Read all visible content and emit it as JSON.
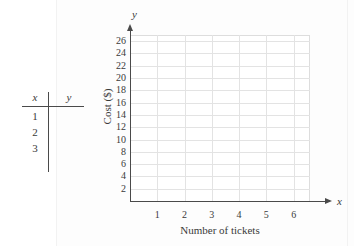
{
  "figure": {
    "kind": "blank-coordinate-grid-with-input-output-table"
  },
  "table": {
    "headers": {
      "x": "x",
      "y": "y"
    },
    "rows": [
      {
        "x": "1",
        "y": ""
      },
      {
        "x": "2",
        "y": ""
      },
      {
        "x": "3",
        "y": ""
      }
    ]
  },
  "chart_data": {
    "type": "scatter",
    "title": "",
    "xlabel": "Number of tickets",
    "ylabel": "Cost ($)",
    "axis_name_x": "x",
    "axis_name_y": "y",
    "x": [],
    "values": [],
    "series": [],
    "xlim": [
      0,
      6.6
    ],
    "ylim": [
      0,
      27
    ],
    "xticks": [
      "1",
      "2",
      "3",
      "4",
      "5",
      "6"
    ],
    "yticks": [
      "2",
      "4",
      "6",
      "8",
      "10",
      "12",
      "14",
      "16",
      "18",
      "20",
      "22",
      "24",
      "26"
    ],
    "xtick_values": [
      1,
      2,
      3,
      4,
      5,
      6
    ],
    "ytick_values": [
      2,
      4,
      6,
      8,
      10,
      12,
      14,
      16,
      18,
      20,
      22,
      24,
      26
    ],
    "grid": true,
    "legend": null,
    "annotations": [],
    "colors": {
      "grid": "#e3e3e3",
      "axis": "#4a4a4a",
      "text": "#3a3a3a",
      "background": "#ffffff"
    }
  }
}
